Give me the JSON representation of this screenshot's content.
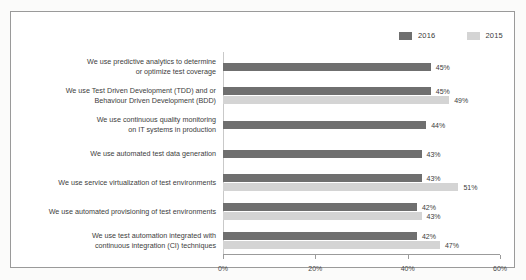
{
  "chart_data": {
    "type": "bar",
    "orientation": "horizontal",
    "title": "",
    "xlabel": "",
    "ylabel": "",
    "xlim": [
      0,
      60
    ],
    "xticks": [
      "0%",
      "20%",
      "40%",
      "60%"
    ],
    "xtick_values": [
      0,
      20,
      40,
      60
    ],
    "grid": false,
    "legend_position": "top-right",
    "colors": {
      "2016": "#6f6f6f",
      "2015": "#d4d4d4"
    },
    "legend": [
      {
        "name": "2016",
        "color": "#6f6f6f"
      },
      {
        "name": "2015",
        "color": "#d4d4d4"
      }
    ],
    "categories": [
      "We use predictive analytics to determine or optimize test coverage",
      "We use Test Driven Development (TDD) and  or Behaviour Driven Development (BDD)",
      "We use continuous quality monitoring on IT systems in production",
      "We use automated  test data generation",
      "We use service virtualization of test environments",
      "We use automated provisioning of test environments",
      "We use test automation integrated with continuous integration (CI) techniques"
    ],
    "series": [
      {
        "name": "2016",
        "values": [
          45,
          45,
          44,
          43,
          43,
          42,
          42
        ]
      },
      {
        "name": "2015",
        "values": [
          null,
          49,
          null,
          null,
          51,
          43,
          47
        ]
      }
    ],
    "rows": [
      {
        "label_lines": [
          "We use predictive analytics to determine",
          "or optimize test coverage"
        ],
        "bars": [
          {
            "series": "2016",
            "value": 45,
            "label": "45%"
          }
        ]
      },
      {
        "label_lines": [
          "We use Test Driven Development (TDD) and  or",
          "Behaviour Driven Development (BDD)"
        ],
        "bars": [
          {
            "series": "2016",
            "value": 45,
            "label": "45%"
          },
          {
            "series": "2015",
            "value": 49,
            "label": "49%"
          }
        ]
      },
      {
        "label_lines": [
          "We use continuous quality monitoring",
          "on IT systems in production"
        ],
        "bars": [
          {
            "series": "2016",
            "value": 44,
            "label": "44%"
          }
        ]
      },
      {
        "label_lines": [
          "We use automated  test data generation"
        ],
        "bars": [
          {
            "series": "2016",
            "value": 43,
            "label": "43%"
          }
        ]
      },
      {
        "label_lines": [
          "We use service virtualization of test environments"
        ],
        "bars": [
          {
            "series": "2016",
            "value": 43,
            "label": "43%"
          },
          {
            "series": "2015",
            "value": 51,
            "label": "51%"
          }
        ]
      },
      {
        "label_lines": [
          "We use automated provisioning of test environments"
        ],
        "bars": [
          {
            "series": "2016",
            "value": 42,
            "label": "42%"
          },
          {
            "series": "2015",
            "value": 43,
            "label": "43%"
          }
        ]
      },
      {
        "label_lines": [
          "We use test automation integrated with",
          "continuous integration (CI) techniques"
        ],
        "bars": [
          {
            "series": "2016",
            "value": 42,
            "label": "42%"
          },
          {
            "series": "2015",
            "value": 47,
            "label": "47%"
          }
        ]
      }
    ]
  }
}
